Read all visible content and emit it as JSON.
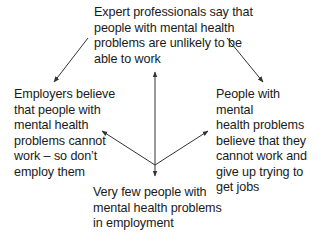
{
  "diagram": {
    "type": "cause-effect cycle",
    "nodes": {
      "top": {
        "text": "Expert professionals say that\npeople with mental health\nproblems are unlikely to be\nable to work"
      },
      "left": {
        "text": "Employers believe\nthat people with\nmental health\nproblems cannot\nwork – so don’t\nemploy them"
      },
      "right": {
        "text": "People with mental\nhealth problems\nbelieve that they\ncannot work and\ngive up trying to\nget jobs"
      },
      "bottom": {
        "text": "Very few people with\nmental health problems\nin employment"
      }
    },
    "edges": [
      {
        "from": "top",
        "to": "left"
      },
      {
        "from": "top",
        "to": "right"
      },
      {
        "from": "hub",
        "to": "top"
      },
      {
        "from": "hub",
        "to": "left"
      },
      {
        "from": "hub",
        "to": "right"
      },
      {
        "from": "hub",
        "to": "bottom"
      }
    ],
    "colors": {
      "text": "#1a1a1a",
      "arrow": "#333333",
      "background": "#ffffff"
    }
  }
}
